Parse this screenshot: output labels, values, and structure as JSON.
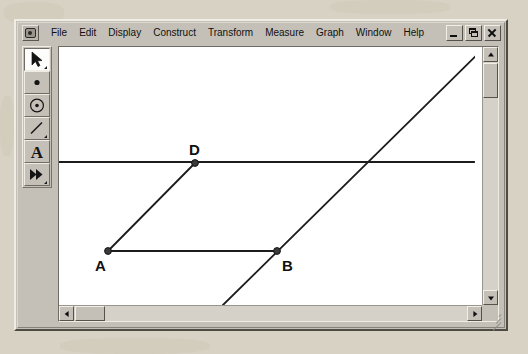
{
  "window": {
    "app_icon_name": "sketchpad-app-icon",
    "menu_items": [
      {
        "label": "File"
      },
      {
        "label": "Edit"
      },
      {
        "label": "Display"
      },
      {
        "label": "Construct"
      },
      {
        "label": "Transform"
      },
      {
        "label": "Measure"
      },
      {
        "label": "Graph"
      },
      {
        "label": "Window"
      },
      {
        "label": "Help"
      }
    ],
    "controls": {
      "minimize": "_",
      "restore": "restore",
      "close": "X"
    }
  },
  "toolbar": {
    "tools": [
      {
        "name": "selection-arrow-tool",
        "selected": true
      },
      {
        "name": "point-tool",
        "selected": false
      },
      {
        "name": "compass-circle-tool",
        "selected": false
      },
      {
        "name": "straightedge-segment-tool",
        "selected": false
      },
      {
        "name": "text-tool",
        "label": "A",
        "selected": false
      },
      {
        "name": "custom-tool",
        "selected": false
      }
    ]
  },
  "sketch": {
    "labels": [
      {
        "text": "A",
        "x": 92,
        "y": 268
      },
      {
        "text": "B",
        "x": 279,
        "y": 268
      },
      {
        "text": "D",
        "x": 186,
        "y": 152
      }
    ],
    "points": [
      {
        "name": "point-a",
        "x": 105,
        "y": 248
      },
      {
        "name": "point-b",
        "x": 274,
        "y": 248
      },
      {
        "name": "point-d",
        "x": 192,
        "y": 160
      }
    ],
    "segments": [
      {
        "name": "segment-ab",
        "x1": 105,
        "y1": 248,
        "x2": 274,
        "y2": 248
      },
      {
        "name": "segment-ad",
        "x1": 105,
        "y1": 248,
        "x2": 192,
        "y2": 160
      }
    ],
    "lines": [
      {
        "name": "horizontal-line-through-d",
        "x1": 56,
        "y1": 159,
        "x2": 471,
        "y2": 159
      },
      {
        "name": "parallel-line-through-b",
        "x1": 220,
        "y1": 302,
        "x2": 482,
        "y2": 44
      }
    ]
  },
  "scrollbars": {
    "vertical": {
      "name": "vertical-scrollbar",
      "up": "up",
      "down": "down"
    },
    "horizontal": {
      "name": "horizontal-scrollbar",
      "left": "left",
      "right": "right"
    }
  }
}
